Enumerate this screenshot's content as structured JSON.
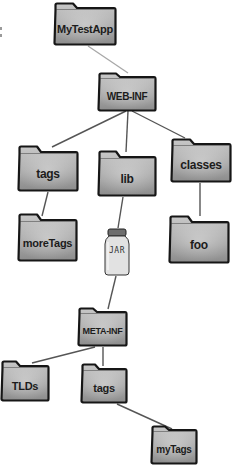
{
  "diagram": {
    "type": "directory-tree",
    "colors": {
      "folder_fill_light": "#c8c8c8",
      "folder_fill_dark": "#8c8c8c",
      "folder_outline": "#161616",
      "jar_fill": "#e2e2e2",
      "jar_lid": "#6e6e6e",
      "edge": "#555555",
      "edge_light": "#a8a8a8"
    },
    "nodes": [
      {
        "id": "mytestapp",
        "kind": "folder",
        "label": "MyTestApp",
        "x": 53,
        "y": 2,
        "w": 64,
        "h": 44,
        "font": 11
      },
      {
        "id": "web-inf",
        "kind": "folder",
        "label": "WEB-INF",
        "x": 97,
        "y": 72,
        "w": 60,
        "h": 40,
        "font": 10
      },
      {
        "id": "tags",
        "kind": "folder",
        "label": "tags",
        "x": 17,
        "y": 145,
        "w": 62,
        "h": 47,
        "font": 12
      },
      {
        "id": "lib",
        "kind": "folder",
        "label": "lib",
        "x": 97,
        "y": 150,
        "w": 60,
        "h": 47,
        "font": 12
      },
      {
        "id": "classes",
        "kind": "folder",
        "label": "classes",
        "x": 170,
        "y": 138,
        "w": 62,
        "h": 45,
        "font": 12
      },
      {
        "id": "moretags",
        "kind": "folder",
        "label": "moreTags",
        "x": 17,
        "y": 213,
        "w": 61,
        "h": 49,
        "font": 11
      },
      {
        "id": "jar",
        "kind": "jar",
        "label": "JAR",
        "x": 104,
        "y": 228,
        "w": 26,
        "h": 48,
        "font": 8
      },
      {
        "id": "foo",
        "kind": "folder",
        "label": "foo",
        "x": 168,
        "y": 215,
        "w": 62,
        "h": 49,
        "font": 12
      },
      {
        "id": "meta-inf",
        "kind": "folder",
        "label": "META-INF",
        "x": 77,
        "y": 307,
        "w": 51,
        "h": 40,
        "font": 9
      },
      {
        "id": "tlds",
        "kind": "folder",
        "label": "TLDs",
        "x": 0,
        "y": 360,
        "w": 50,
        "h": 42,
        "font": 11
      },
      {
        "id": "tags-2",
        "kind": "folder",
        "label": "tags",
        "x": 80,
        "y": 363,
        "w": 48,
        "h": 41,
        "font": 11
      },
      {
        "id": "mytags",
        "kind": "folder",
        "label": "myTags",
        "x": 150,
        "y": 425,
        "w": 48,
        "h": 40,
        "font": 10
      }
    ],
    "edges": [
      {
        "from": "mytestapp",
        "to": "web-inf",
        "x1": 88,
        "y1": 46,
        "x2": 128,
        "y2": 73,
        "light": true
      },
      {
        "from": "web-inf",
        "to": "tags",
        "x1": 126,
        "y1": 111,
        "x2": 52,
        "y2": 147
      },
      {
        "from": "web-inf",
        "to": "lib",
        "x1": 128,
        "y1": 111,
        "x2": 126,
        "y2": 152
      },
      {
        "from": "web-inf",
        "to": "classes",
        "x1": 132,
        "y1": 111,
        "x2": 185,
        "y2": 138
      },
      {
        "from": "tags",
        "to": "moretags",
        "x1": 48,
        "y1": 192,
        "x2": 42,
        "y2": 216
      },
      {
        "from": "lib",
        "to": "jar",
        "x1": 123,
        "y1": 197,
        "x2": 118,
        "y2": 228
      },
      {
        "from": "classes",
        "to": "foo",
        "x1": 200,
        "y1": 183,
        "x2": 200,
        "y2": 216
      },
      {
        "from": "jar",
        "to": "meta-inf",
        "x1": 116,
        "y1": 276,
        "x2": 108,
        "y2": 309
      },
      {
        "from": "meta-inf",
        "to": "tlds",
        "x1": 95,
        "y1": 347,
        "x2": 32,
        "y2": 363
      },
      {
        "from": "meta-inf",
        "to": "tags-2",
        "x1": 103,
        "y1": 347,
        "x2": 103,
        "y2": 366
      },
      {
        "from": "tags-2",
        "to": "mytags",
        "x1": 117,
        "y1": 404,
        "x2": 172,
        "y2": 429
      }
    ]
  }
}
